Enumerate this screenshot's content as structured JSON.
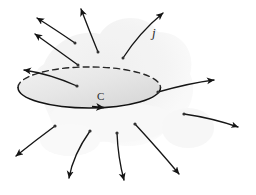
{
  "figure": {
    "type": "vector-diagram",
    "title_text": "",
    "canvas": {
      "width": 256,
      "height": 195,
      "background": "#ffffff"
    },
    "labels": [
      {
        "id": "current-density",
        "text": "j",
        "x": 152,
        "y": 37,
        "style": "italic-serif",
        "color": "#2b2b2b",
        "font_size": 13
      },
      {
        "id": "boundary-curve",
        "text": "C",
        "x": 97,
        "y": 100,
        "style": "serif",
        "color": "#2b2b2b",
        "font_size": 11
      }
    ],
    "colors": {
      "stroke": "#1a1a1a",
      "dashed_stroke": "#2a2a2a",
      "surface_fill_light": "#ededed",
      "surface_fill_dark": "#d2d2d2",
      "blob_fill": "#f1f1f1",
      "blob_fill_soft": "#f6f6f6",
      "dot_fill": "#3a3a3a",
      "background": "#ffffff"
    },
    "surface": {
      "name": "open-surface-ellipse",
      "center_x": 89,
      "center_y": 88,
      "radius_x": 71,
      "radius_y": 20,
      "top_edge": "dashed",
      "bottom_edge": "solid",
      "fill": "#e8e8e8"
    },
    "blob": {
      "name": "background-field-region",
      "description": "faint light-gray cloud silhouette behind the surface",
      "fill": "#f2f2f2"
    },
    "arrows": [
      {
        "id": "arrow-top-left-out",
        "group": "upper",
        "tail": [
          75,
          43
        ],
        "ctrl": [
          53,
          28
        ],
        "head": [
          36,
          17
        ],
        "tail_dot": true
      },
      {
        "id": "arrow-top-mid-out",
        "group": "upper",
        "tail": [
          98,
          52
        ],
        "ctrl": [
          88,
          30
        ],
        "head": [
          80,
          8
        ],
        "tail_dot": true
      },
      {
        "id": "arrow-top-right-out",
        "group": "upper",
        "tail": [
          123,
          58
        ],
        "ctrl": [
          138,
          34
        ],
        "head": [
          164,
          12
        ],
        "tail_dot": true
      },
      {
        "id": "arrow-left-upper-out",
        "group": "upper",
        "tail": [
          78,
          65
        ],
        "ctrl": [
          52,
          46
        ],
        "head": [
          34,
          33
        ],
        "tail_dot": true
      },
      {
        "id": "arrow-left-through",
        "group": "middle",
        "tail": [
          77,
          86
        ],
        "ctrl": [
          50,
          74
        ],
        "head": [
          23,
          70
        ],
        "tail_dot": true
      },
      {
        "id": "arrow-right-through",
        "group": "middle",
        "tail": [
          158,
          92
        ],
        "ctrl": [
          190,
          83
        ],
        "head": [
          215,
          80
        ],
        "tail_dot": true
      },
      {
        "id": "arrow-lower-left-1",
        "group": "lower",
        "tail": [
          55,
          126
        ],
        "ctrl": [
          35,
          140
        ],
        "head": [
          14,
          157
        ],
        "tail_dot": true
      },
      {
        "id": "arrow-lower-left-2",
        "group": "lower",
        "tail": [
          90,
          131
        ],
        "ctrl": [
          73,
          155
        ],
        "head": [
          68,
          180
        ],
        "tail_dot": true
      },
      {
        "id": "arrow-lower-mid",
        "group": "lower",
        "tail": [
          117,
          133
        ],
        "ctrl": [
          118,
          158
        ],
        "head": [
          124,
          182
        ],
        "tail_dot": true
      },
      {
        "id": "arrow-lower-right-1",
        "group": "lower",
        "tail": [
          135,
          124
        ],
        "ctrl": [
          158,
          150
        ],
        "head": [
          180,
          176
        ],
        "tail_dot": true
      },
      {
        "id": "arrow-lower-right-2",
        "group": "lower",
        "tail": [
          184,
          114
        ],
        "ctrl": [
          212,
          118
        ],
        "head": [
          240,
          128
        ],
        "tail_dot": true
      }
    ],
    "boundary_direction_marker": {
      "id": "curve-orientation-arrowhead",
      "x": 100,
      "y": 107,
      "direction": "rightward-along-bottom-edge"
    }
  }
}
